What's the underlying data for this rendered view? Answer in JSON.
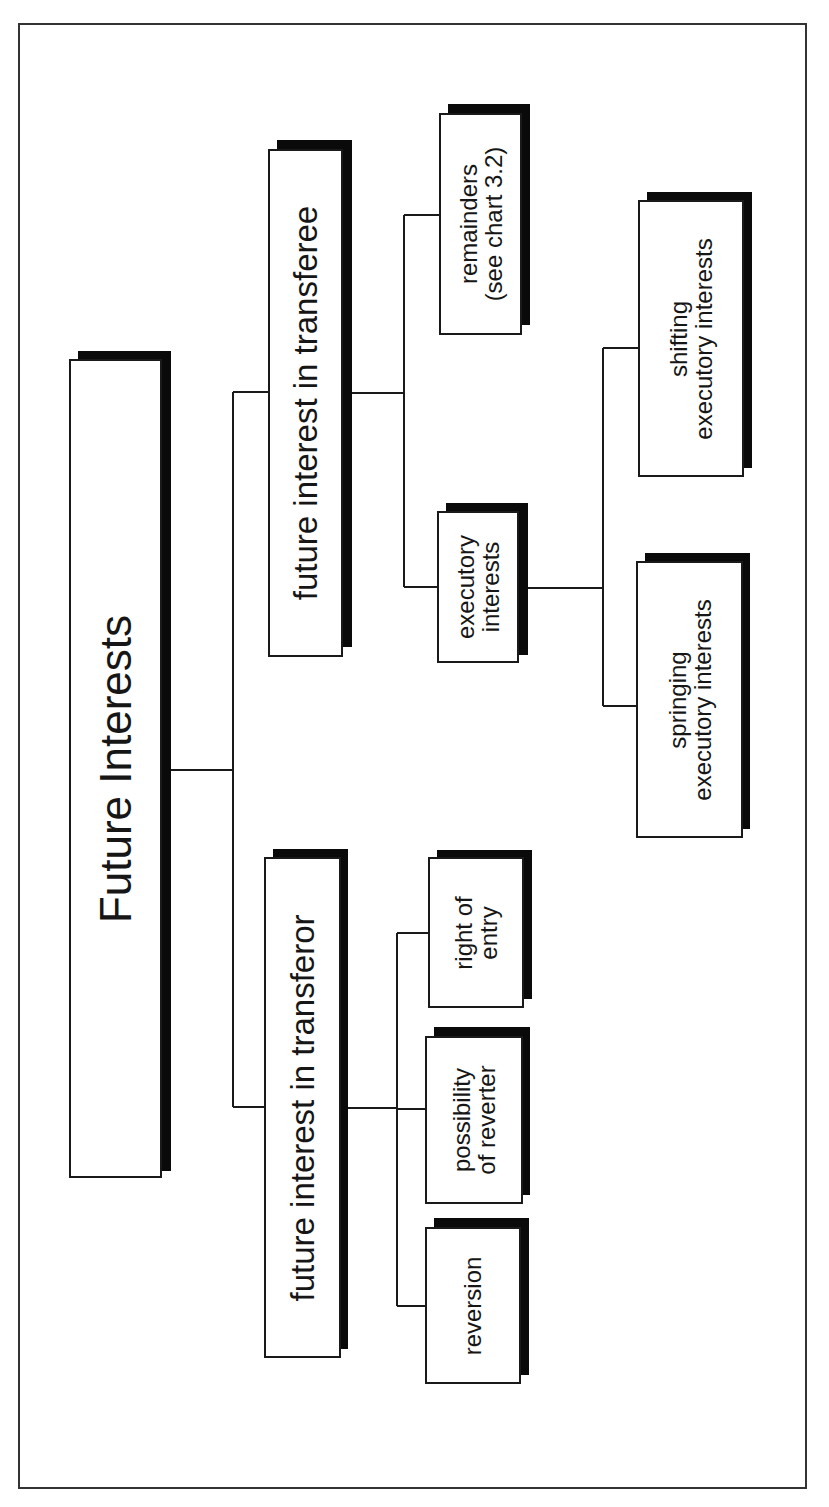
{
  "diagram": {
    "type": "tree",
    "orientation": "rotated-90-ccw",
    "colors": {
      "box_fill": "#ffffff",
      "box_border": "#1a1a1a",
      "shadow": "#0a0a0a",
      "line": "#1a1a1a",
      "frame": "#333333"
    },
    "root": {
      "label": "Future Interests",
      "children": [
        {
          "label": "future interest in transferor",
          "children": [
            {
              "label_lines": [
                "reversion"
              ]
            },
            {
              "label_lines": [
                "possibility",
                "of reverter"
              ]
            },
            {
              "label_lines": [
                "right of",
                "entry"
              ]
            }
          ]
        },
        {
          "label": "future interest in transferee",
          "children": [
            {
              "label_lines": [
                "executory",
                "interests"
              ],
              "children": [
                {
                  "label_lines": [
                    "springing",
                    "executory interests"
                  ]
                },
                {
                  "label_lines": [
                    "shifting",
                    "executory interests"
                  ]
                }
              ]
            },
            {
              "label_lines": [
                "remainders",
                "(see chart 3.2)"
              ]
            }
          ]
        }
      ]
    }
  },
  "nodes": {
    "root": {
      "label": "Future Interests"
    },
    "transferor": {
      "label": "future interest in transferor"
    },
    "transferee": {
      "label": "future interest in transferee"
    },
    "reversion": {
      "line1": "reversion"
    },
    "possibility": {
      "line1": "possibility",
      "line2": "of reverter"
    },
    "right_of_entry": {
      "line1": "right of",
      "line2": "entry"
    },
    "executory": {
      "line1": "executory",
      "line2": "interests"
    },
    "remainders": {
      "line1": "remainders",
      "line2": "(see chart 3.2)"
    },
    "springing": {
      "line1": "springing",
      "line2": "executory interests"
    },
    "shifting": {
      "line1": "shifting",
      "line2": "executory interests"
    }
  }
}
